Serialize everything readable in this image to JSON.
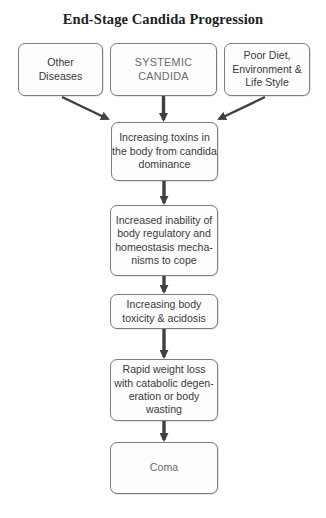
{
  "title": "End-Stage Candida Progression",
  "colors": {
    "box_border": "#7d7d7d",
    "arrow": "#404040",
    "text": "#3a3a3a",
    "title": "#1e1e1e"
  },
  "top_row": [
    {
      "id": "other-diseases",
      "label": "Other\nDiseases"
    },
    {
      "id": "systemic-candida",
      "label": "SYSTEMIC\nCANDIDA"
    },
    {
      "id": "poor-diet",
      "label": "Poor Diet,\nEnvironment &\nLife Style"
    }
  ],
  "steps": [
    {
      "id": "toxins",
      "label": "Increasing toxins in\nthe body from candida\ndominance"
    },
    {
      "id": "regulatory-inability",
      "label": "Increased inability of\nbody regulatory and\nhomeostasis mecha-\nnisms to cope"
    },
    {
      "id": "toxicity-acidosis",
      "label": "Increasing body\ntoxicity & acidosis"
    },
    {
      "id": "weight-loss",
      "label": "Rapid weight loss\nwith catabolic degen-\neration or body\nwasting"
    },
    {
      "id": "coma",
      "label": "Coma"
    }
  ],
  "edges": [
    {
      "from": "other-diseases",
      "to": "toxins"
    },
    {
      "from": "systemic-candida",
      "to": "toxins"
    },
    {
      "from": "poor-diet",
      "to": "toxins"
    },
    {
      "from": "toxins",
      "to": "regulatory-inability"
    },
    {
      "from": "regulatory-inability",
      "to": "toxicity-acidosis"
    },
    {
      "from": "toxicity-acidosis",
      "to": "weight-loss"
    },
    {
      "from": "weight-loss",
      "to": "coma"
    }
  ]
}
